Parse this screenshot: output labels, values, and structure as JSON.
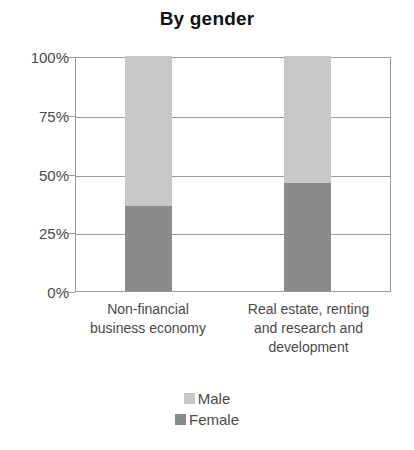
{
  "chart_data": {
    "type": "bar",
    "subtype": "stacked-percentage-column",
    "title": "By gender",
    "xlabel": "",
    "ylabel": "",
    "ylim": [
      0,
      100
    ],
    "yunit": "%",
    "grid": true,
    "legend_position": "bottom",
    "categories": [
      "Non-financial business economy",
      "Real estate, renting and research and development"
    ],
    "category_lines": [
      [
        "Non-financial",
        "business economy"
      ],
      [
        "Real estate, renting",
        "and research and",
        "development"
      ]
    ],
    "y_ticks": [
      0,
      25,
      50,
      75,
      100
    ],
    "y_tick_labels": [
      "0%",
      "25%",
      "50%",
      "75%",
      "100%"
    ],
    "series": [
      {
        "name": "Female",
        "color": "#8a8a8a",
        "values": [
          36,
          46
        ]
      },
      {
        "name": "Male",
        "color": "#c8c8c8",
        "values": [
          64,
          54
        ]
      }
    ],
    "legend": [
      {
        "label": "Male",
        "color": "#c8c8c8"
      },
      {
        "label": "Female",
        "color": "#8a8a8a"
      }
    ]
  }
}
